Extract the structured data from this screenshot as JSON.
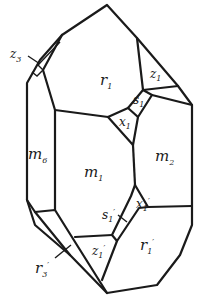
{
  "figure": {
    "type": "crystal-drawing",
    "faces": {
      "r1": {
        "letter": "r",
        "sub": "1"
      },
      "z1": {
        "letter": "z",
        "sub": "1"
      },
      "z3": {
        "letter": "z",
        "sub": "3"
      },
      "s1": {
        "letter": "s",
        "sub": "1"
      },
      "x1": {
        "letter": "x",
        "sub": "1"
      },
      "m1": {
        "letter": "m",
        "sub": "1"
      },
      "m2": {
        "letter": "m",
        "sub": "2"
      },
      "m6": {
        "letter": "m",
        "sub": "6"
      },
      "s1p": {
        "letter": "s",
        "sub": "1",
        "prime": "′"
      },
      "x1p": {
        "letter": "x",
        "sub": "1",
        "prime": "′"
      },
      "z1p": {
        "letter": "z",
        "sub": "1",
        "prime": "′"
      },
      "r1p": {
        "letter": "r",
        "sub": "1",
        "prime": "′"
      },
      "r3p": {
        "letter": "r",
        "sub": "3",
        "prime": "′"
      }
    }
  }
}
